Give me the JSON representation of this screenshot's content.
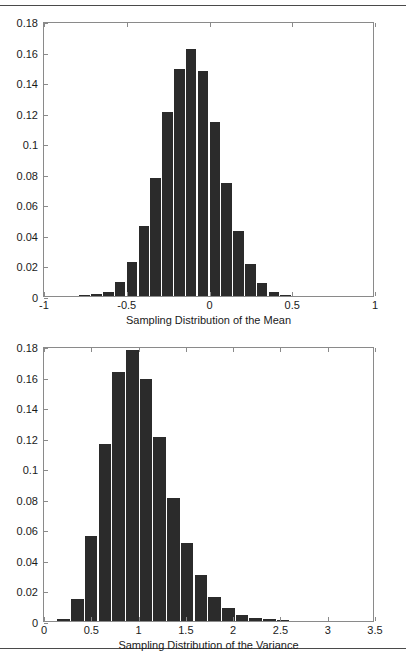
{
  "page": {
    "background": "#ffffff",
    "bar_color": "#2b2b2b",
    "axis_color": "#8a8a8a",
    "rule_color": "#4a4a4a",
    "width": 406,
    "height": 655
  },
  "rules": {
    "top_label": "top-horizontal-rule",
    "bottom_label": "bottom-horizontal-rule"
  },
  "chart_data": [
    {
      "id": "sampling-distribution-mean",
      "type": "bar",
      "title": "",
      "xlabel": "Sampling Distribution of the Mean",
      "ylabel": "",
      "xlim": [
        -1,
        1
      ],
      "ylim": [
        0,
        0.18
      ],
      "grid": false,
      "legend": null,
      "xticks": [
        -1,
        -0.5,
        0,
        0.5,
        1
      ],
      "xticklabels": [
        "-1",
        "-0.5",
        "0",
        "0.5",
        "1"
      ],
      "yticks": [
        0,
        0.02,
        0.04,
        0.06,
        0.08,
        0.1,
        0.12,
        0.14,
        0.16,
        0.18
      ],
      "yticklabels": [
        "0",
        "0.02",
        "0.04",
        "0.06",
        "0.08",
        "0.1",
        "0.12",
        "0.14",
        "0.16",
        "0.18"
      ],
      "bin_width": 0.0714,
      "bin_centers": [
        -0.75,
        -0.679,
        -0.607,
        -0.536,
        -0.464,
        -0.393,
        -0.321,
        -0.25,
        -0.179,
        -0.107,
        -0.036,
        0.036,
        0.107,
        0.179,
        0.25,
        0.321,
        0.393,
        0.464,
        0.536,
        0.607,
        0.679,
        0.75
      ],
      "values": [
        0.0005,
        0.0012,
        0.0028,
        0.0091,
        0.0223,
        0.0459,
        0.0772,
        0.1204,
        0.1486,
        0.1614,
        0.147,
        0.1138,
        0.0738,
        0.0428,
        0.0207,
        0.0086,
        0.0027,
        0.0008
      ]
    },
    {
      "id": "sampling-distribution-variance",
      "type": "bar",
      "title": "",
      "xlabel": "Sampling Distribution of the Variance",
      "ylabel": "",
      "xlim": [
        0,
        3.5
      ],
      "ylim": [
        0,
        0.18
      ],
      "grid": false,
      "legend": null,
      "xticks": [
        0,
        0.5,
        1,
        1.5,
        2,
        2.5,
        3,
        3.5
      ],
      "xticklabels": [
        "0",
        "0.5",
        "1",
        "1.5",
        "2",
        "2.5",
        "3",
        "3.5"
      ],
      "yticks": [
        0,
        0.02,
        0.04,
        0.06,
        0.08,
        0.1,
        0.12,
        0.14,
        0.16,
        0.18
      ],
      "yticklabels": [
        "0",
        "0.02",
        "0.04",
        "0.06",
        "0.08",
        "0.1",
        "0.12",
        "0.14",
        "0.16",
        "0.18"
      ],
      "bin_width": 0.145,
      "bin_centers": [
        0.215,
        0.36,
        0.505,
        0.65,
        0.795,
        0.94,
        1.085,
        1.23,
        1.375,
        1.52,
        1.665,
        1.81,
        1.955,
        2.1,
        2.245,
        2.39,
        2.535
      ],
      "values": [
        0.0013,
        0.0143,
        0.0557,
        0.1157,
        0.1632,
        0.1771,
        0.1583,
        0.1203,
        0.0803,
        0.0511,
        0.0302,
        0.0157,
        0.0085,
        0.0039,
        0.0017,
        0.001,
        0.0004
      ]
    }
  ]
}
